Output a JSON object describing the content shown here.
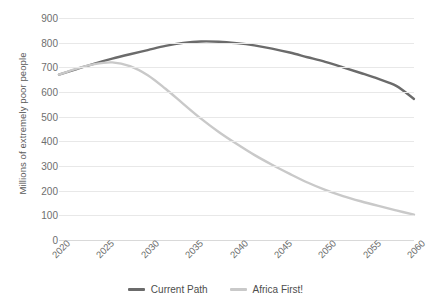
{
  "chart_data": {
    "type": "line",
    "title": "",
    "subtitle": "",
    "xlabel": "",
    "ylabel": "Millions of extremely poor people",
    "x": [
      2020,
      2025,
      2030,
      2035,
      2040,
      2045,
      2050,
      2055,
      2060
    ],
    "xlim": [
      2020,
      2060
    ],
    "ylim": [
      0,
      900
    ],
    "yticks": [
      0,
      100,
      200,
      300,
      400,
      500,
      600,
      700,
      800,
      900
    ],
    "xticklabels": [
      "2020",
      "2025",
      "2030",
      "2035",
      "2040",
      "2045",
      "2050",
      "2055",
      "2060"
    ],
    "yticklabels": [
      "0",
      "100",
      "200",
      "300",
      "400",
      "500",
      "600",
      "700",
      "800",
      "900"
    ],
    "grid": "horizontal",
    "legend_position": "bottom-center",
    "series": [
      {
        "name": "Current Path",
        "color": "#6b6b6b",
        "x": [
          2020,
          2022,
          2024,
          2026,
          2028,
          2030,
          2032,
          2034,
          2036,
          2038,
          2040,
          2042,
          2044,
          2046,
          2048,
          2050,
          2052,
          2054,
          2056,
          2058,
          2060
        ],
        "values": [
          670,
          693,
          715,
          735,
          753,
          770,
          787,
          799,
          805,
          804,
          798,
          789,
          776,
          760,
          741,
          722,
          700,
          677,
          653,
          625,
          572
        ]
      },
      {
        "name": "Africa First!",
        "color": "#c9c9c9",
        "x": [
          2020,
          2022,
          2024,
          2026,
          2028,
          2030,
          2032,
          2034,
          2036,
          2038,
          2040,
          2042,
          2044,
          2046,
          2048,
          2050,
          2052,
          2054,
          2056,
          2058,
          2060
        ],
        "values": [
          670,
          695,
          713,
          720,
          705,
          668,
          613,
          552,
          492,
          438,
          390,
          345,
          305,
          268,
          233,
          203,
          178,
          157,
          138,
          120,
          103
        ]
      }
    ]
  },
  "legend": {
    "items": [
      {
        "label": "Current Path",
        "color": "#6b6b6b"
      },
      {
        "label": "Africa First!",
        "color": "#c9c9c9"
      }
    ]
  }
}
